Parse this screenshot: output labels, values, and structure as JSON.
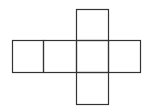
{
  "diagram": {
    "type": "cube-net",
    "stroke_color": "#333333",
    "background": "#ffffff",
    "cell_size": 32,
    "squares": [
      {
        "id": "top",
        "x": 76,
        "y": 9,
        "w": 32,
        "h": 31
      },
      {
        "id": "row-1",
        "x": 12,
        "y": 40,
        "w": 31,
        "h": 32
      },
      {
        "id": "row-2",
        "x": 43,
        "y": 40,
        "w": 33,
        "h": 32
      },
      {
        "id": "row-3",
        "x": 76,
        "y": 40,
        "w": 32,
        "h": 32
      },
      {
        "id": "row-4",
        "x": 108,
        "y": 40,
        "w": 32,
        "h": 32
      },
      {
        "id": "bottom",
        "x": 76,
        "y": 72,
        "w": 32,
        "h": 32
      }
    ]
  }
}
